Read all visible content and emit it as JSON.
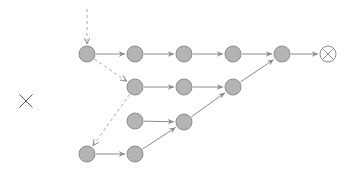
{
  "diagram": {
    "type": "state-transition-graph",
    "colors": {
      "node_fill": "#b4b4b4",
      "node_stroke": "#8c8c8c",
      "edge": "#8a8a8a",
      "dashed_edge": "#a8a8a8",
      "terminal_stroke": "#8c8c8c",
      "cross_mark": "#555555"
    },
    "node_radius": 8,
    "side_mark": {
      "symbol": "cross-icon",
      "x": 26,
      "y": 101,
      "size": 13
    },
    "entry": {
      "x": 87,
      "y1": 9,
      "y2": 44
    },
    "nodes": [
      {
        "id": "n1",
        "x": 87,
        "y": 54
      },
      {
        "id": "n2",
        "x": 135,
        "y": 54
      },
      {
        "id": "n3",
        "x": 184,
        "y": 54
      },
      {
        "id": "n4",
        "x": 233,
        "y": 54
      },
      {
        "id": "n5",
        "x": 282,
        "y": 54
      },
      {
        "id": "m1",
        "x": 135,
        "y": 87
      },
      {
        "id": "m2",
        "x": 184,
        "y": 87
      },
      {
        "id": "m3",
        "x": 233,
        "y": 87
      },
      {
        "id": "r1",
        "x": 135,
        "y": 121
      },
      {
        "id": "r2",
        "x": 184,
        "y": 122
      },
      {
        "id": "b1",
        "x": 87,
        "y": 154
      },
      {
        "id": "b2",
        "x": 135,
        "y": 154
      }
    ],
    "terminal": {
      "id": "end",
      "x": 328,
      "y": 54,
      "symbol": "otimes-icon"
    },
    "edges": [
      {
        "from": "n1",
        "to": "n2",
        "style": "solid"
      },
      {
        "from": "n2",
        "to": "n3",
        "style": "solid"
      },
      {
        "from": "n3",
        "to": "n4",
        "style": "solid"
      },
      {
        "from": "n4",
        "to": "n5",
        "style": "solid"
      },
      {
        "from": "n5",
        "to": "end",
        "style": "solid"
      },
      {
        "from": "n1",
        "to": "m1",
        "style": "dashed"
      },
      {
        "from": "m1",
        "to": "m2",
        "style": "solid"
      },
      {
        "from": "m2",
        "to": "m3",
        "style": "solid"
      },
      {
        "from": "m3",
        "to": "n5",
        "style": "solid"
      },
      {
        "from": "m1",
        "to": "b1",
        "style": "dashed"
      },
      {
        "from": "r1",
        "to": "r2",
        "style": "solid"
      },
      {
        "from": "r2",
        "to": "m3",
        "style": "solid"
      },
      {
        "from": "b1",
        "to": "b2",
        "style": "solid"
      },
      {
        "from": "b2",
        "to": "r2",
        "style": "solid"
      }
    ]
  }
}
